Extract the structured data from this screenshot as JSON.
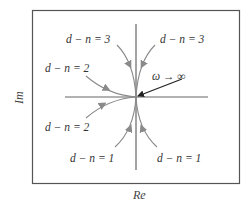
{
  "diagram": {
    "type": "polar-plot-asymptotic-behavior",
    "axes": {
      "x_label": "Re",
      "y_label": "Im"
    },
    "annotation": {
      "omega_label": "ω → ∞"
    },
    "curves": [
      {
        "id": "dn3-left",
        "label": "d − n = 3",
        "quadrant": "upper-left"
      },
      {
        "id": "dn3-right",
        "label": "d − n = 3",
        "quadrant": "upper-right"
      },
      {
        "id": "dn2-upper",
        "label": "d − n = 2",
        "quadrant": "left-upper"
      },
      {
        "id": "dn2-lower",
        "label": "d − n = 2",
        "quadrant": "left-lower"
      },
      {
        "id": "dn1-left",
        "label": "d − n = 1",
        "quadrant": "lower-left"
      },
      {
        "id": "dn1-right",
        "label": "d − n = 1",
        "quadrant": "lower-right"
      }
    ],
    "colors": {
      "frame": "#555555",
      "axes": "#666666",
      "curves": "#8a8a8a",
      "arrow": "#222222",
      "text": "#333333"
    }
  }
}
